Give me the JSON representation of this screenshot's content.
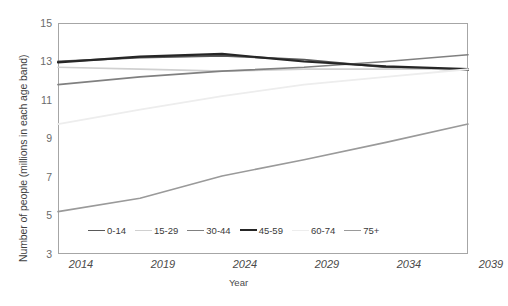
{
  "chart_data": {
    "type": "line",
    "title": "",
    "xlabel": "Year",
    "ylabel": "Number of people (millions in each age band)",
    "x": [
      2014,
      2019,
      2024,
      2029,
      2034,
      2039
    ],
    "xtick_labels": [
      "2014",
      "2019",
      "2024",
      "2029",
      "2034",
      "2039"
    ],
    "ytick_labels": [
      "15",
      "13",
      "11",
      "9",
      "7",
      "5",
      "3"
    ],
    "yticks": [
      15,
      13,
      11,
      9,
      7,
      5,
      3
    ],
    "ylim": [
      3,
      15
    ],
    "xlim": [
      2014,
      2039
    ],
    "grid": false,
    "legend_position": "inside-bottom",
    "series": [
      {
        "name": "0-14",
        "color": "#595959",
        "width": 1.9,
        "values": [
          13.0,
          13.2,
          13.3,
          13.1,
          12.7,
          12.55
        ]
      },
      {
        "name": "15-29",
        "color": "#d0d0d0",
        "width": 1.7,
        "values": [
          12.7,
          12.6,
          12.5,
          12.6,
          12.6,
          12.6
        ]
      },
      {
        "name": "30-44",
        "color": "#808080",
        "width": 1.7,
        "values": [
          11.8,
          12.2,
          12.5,
          12.7,
          13.0,
          13.35
        ]
      },
      {
        "name": "45-59",
        "color": "#262626",
        "width": 2.2,
        "values": [
          12.95,
          13.25,
          13.4,
          13.0,
          12.75,
          12.6
        ]
      },
      {
        "name": "60-74",
        "color": "#ededed",
        "width": 1.9,
        "values": [
          9.75,
          10.5,
          11.2,
          11.8,
          12.2,
          12.6
        ]
      },
      {
        "name": "75+",
        "color": "#9a9a9a",
        "width": 1.6,
        "values": [
          5.2,
          5.9,
          7.05,
          7.9,
          8.8,
          9.75
        ]
      }
    ]
  },
  "legend": {
    "items": [
      {
        "label": "0-14"
      },
      {
        "label": "15-29"
      },
      {
        "label": "30-44"
      },
      {
        "label": "45-59"
      },
      {
        "label": "60-74"
      },
      {
        "label": "75+"
      }
    ]
  }
}
